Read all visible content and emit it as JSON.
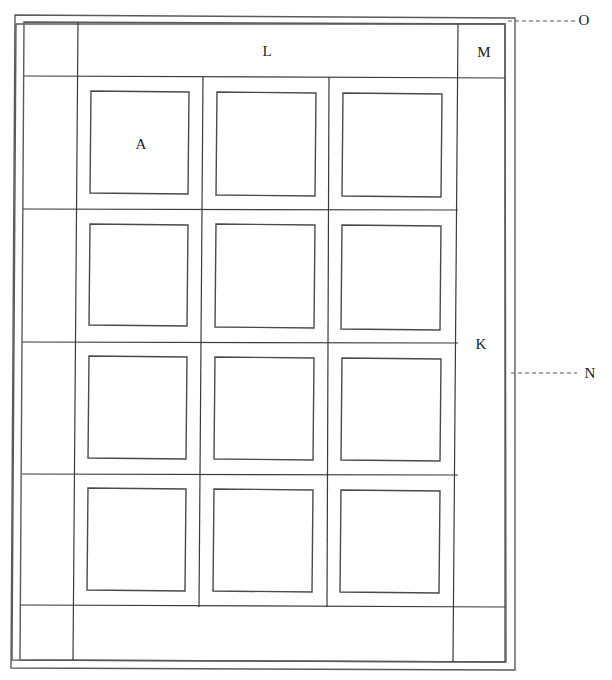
{
  "diagram": {
    "title": "",
    "type": "quilt-layout",
    "colors": {
      "line": "#3a3a3a",
      "background": "#ffffff",
      "text": "#1a1a1a"
    },
    "binding": {
      "polygon": [
        [
          15,
          15
        ],
        [
          515,
          18
        ],
        [
          515,
          670
        ],
        [
          11,
          668
        ]
      ],
      "inner_polygon": [
        [
          16,
          24
        ],
        [
          505,
          24
        ],
        [
          506,
          662
        ],
        [
          12,
          660
        ]
      ]
    },
    "border_frame": {
      "polygon": [
        [
          24,
          22
        ],
        [
          505,
          24
        ],
        [
          505,
          662
        ],
        [
          20,
          660
        ]
      ]
    },
    "grid_lines": {
      "vertical": [
        [
          [
            78,
            22
          ],
          [
            73,
            660
          ]
        ],
        [
          [
            203,
            77
          ],
          [
            199,
            607
          ]
        ],
        [
          [
            329,
            77
          ],
          [
            327,
            607
          ]
        ],
        [
          [
            458,
            24
          ],
          [
            453,
            662
          ]
        ]
      ],
      "horizontal": [
        [
          [
            24,
            76
          ],
          [
            505,
            78
          ]
        ],
        [
          [
            23,
            209
          ],
          [
            458,
            210
          ]
        ],
        [
          [
            22,
            342
          ],
          [
            458,
            343
          ]
        ],
        [
          [
            22,
            474
          ],
          [
            458,
            475
          ]
        ],
        [
          [
            20,
            605
          ],
          [
            505,
            607
          ]
        ]
      ]
    },
    "blocks": [
      {
        "id": "A",
        "label": "A",
        "points": [
          [
            91,
            91
          ],
          [
            189,
            92
          ],
          [
            188,
            194
          ],
          [
            90,
            193
          ]
        ]
      },
      {
        "id": "r1c2",
        "label": "",
        "points": [
          [
            217,
            92
          ],
          [
            316,
            93
          ],
          [
            315,
            196
          ],
          [
            216,
            195
          ]
        ]
      },
      {
        "id": "r1c3",
        "label": "",
        "points": [
          [
            343,
            93
          ],
          [
            442,
            94
          ],
          [
            441,
            197
          ],
          [
            342,
            196
          ]
        ]
      },
      {
        "id": "r2c1",
        "label": "",
        "points": [
          [
            90,
            224
          ],
          [
            188,
            225
          ],
          [
            187,
            326
          ],
          [
            89,
            325
          ]
        ]
      },
      {
        "id": "r2c2",
        "label": "",
        "points": [
          [
            216,
            224
          ],
          [
            315,
            225
          ],
          [
            314,
            328
          ],
          [
            215,
            327
          ]
        ]
      },
      {
        "id": "r2c3",
        "label": "",
        "points": [
          [
            342,
            225
          ],
          [
            441,
            226
          ],
          [
            440,
            330
          ],
          [
            341,
            329
          ]
        ]
      },
      {
        "id": "r3c1",
        "label": "",
        "points": [
          [
            89,
            356
          ],
          [
            187,
            357
          ],
          [
            186,
            459
          ],
          [
            88,
            458
          ]
        ]
      },
      {
        "id": "r3c2",
        "label": "",
        "points": [
          [
            215,
            357
          ],
          [
            314,
            358
          ],
          [
            313,
            460
          ],
          [
            214,
            459
          ]
        ]
      },
      {
        "id": "r3c3",
        "label": "",
        "points": [
          [
            342,
            358
          ],
          [
            441,
            359
          ],
          [
            440,
            461
          ],
          [
            341,
            460
          ]
        ]
      },
      {
        "id": "r4c1",
        "label": "",
        "points": [
          [
            88,
            488
          ],
          [
            186,
            489
          ],
          [
            185,
            591
          ],
          [
            87,
            590
          ]
        ]
      },
      {
        "id": "r4c2",
        "label": "",
        "points": [
          [
            214,
            489
          ],
          [
            313,
            490
          ],
          [
            312,
            592
          ],
          [
            213,
            591
          ]
        ]
      },
      {
        "id": "r4c3",
        "label": "",
        "points": [
          [
            341,
            490
          ],
          [
            440,
            491
          ],
          [
            439,
            593
          ],
          [
            340,
            592
          ]
        ]
      }
    ],
    "labels": [
      {
        "id": "A",
        "text": "A",
        "x": 141,
        "y": 149,
        "target": "quilt-block"
      },
      {
        "id": "K",
        "text": "K",
        "x": 481,
        "y": 349,
        "target": "side-border"
      },
      {
        "id": "L",
        "text": "L",
        "x": 267,
        "y": 56,
        "target": "top-border"
      },
      {
        "id": "M",
        "text": "M",
        "x": 484,
        "y": 57,
        "target": "corner-square"
      },
      {
        "id": "N",
        "text": "N",
        "x": 590,
        "y": 378,
        "target": "binding-side"
      },
      {
        "id": "O",
        "text": "O",
        "x": 584,
        "y": 25,
        "target": "binding-top"
      }
    ],
    "leaders": [
      {
        "id": "O-leader",
        "from": [
          508,
          21
        ],
        "to": [
          577,
          21
        ]
      },
      {
        "id": "N-leader",
        "from": [
          511,
          373
        ],
        "to": [
          577,
          373
        ]
      }
    ]
  }
}
